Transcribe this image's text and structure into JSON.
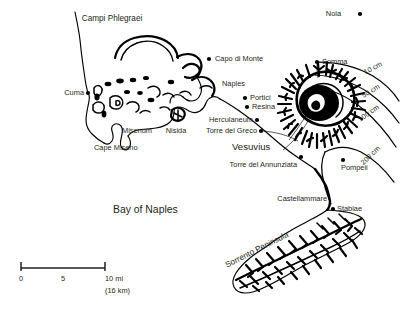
{
  "map": {
    "title_region": "Bay of Naples",
    "volcano": "Vesuvius",
    "regions": [
      {
        "name": "Campi Phlegraei",
        "x": 112,
        "y": 21
      },
      {
        "name": "Sorrento Peninsula",
        "x": 258,
        "y": 252,
        "rotate": -27
      }
    ],
    "places": [
      {
        "name": "Nola",
        "label_x": 341,
        "label_y": 16,
        "anchor": "end",
        "dot_x": 360,
        "dot_y": 14
      },
      {
        "name": "Somma",
        "label_x": 322,
        "label_y": 64,
        "anchor": "start",
        "dot_x": 317,
        "dot_y": 62
      },
      {
        "name": "Capo di Monte",
        "label_x": 215,
        "label_y": 61,
        "anchor": "start",
        "dot_x": 209,
        "dot_y": 59
      },
      {
        "name": "Naples",
        "label_x": 222,
        "label_y": 86,
        "anchor": "start",
        "dot_x": null,
        "dot_y": null
      },
      {
        "name": "Cuma",
        "label_x": 84,
        "label_y": 95,
        "anchor": "end",
        "dot_x": 88,
        "dot_y": 93
      },
      {
        "name": "Portici",
        "label_x": 250,
        "label_y": 100,
        "anchor": "start",
        "dot_x": 245,
        "dot_y": 98
      },
      {
        "name": "Resina",
        "label_x": 252,
        "label_y": 109,
        "anchor": "start",
        "dot_x": 247,
        "dot_y": 107
      },
      {
        "name": "Nisida",
        "label_x": 176,
        "label_y": 133,
        "anchor": "middle",
        "dot_x": null,
        "dot_y": null
      },
      {
        "name": "Misenum",
        "label_x": 122,
        "label_y": 133,
        "anchor": "start",
        "dot_x": null,
        "dot_y": null
      },
      {
        "name": "Herculaneum",
        "label_x": 253,
        "label_y": 122,
        "anchor": "end",
        "dot_x": 257,
        "dot_y": 120
      },
      {
        "name": "Torre del Greco",
        "label_x": 257,
        "label_y": 133,
        "anchor": "end",
        "dot_x": 261,
        "dot_y": 131
      },
      {
        "name": "Cape Miseno",
        "label_x": 94,
        "label_y": 150,
        "anchor": "start",
        "dot_x": null,
        "dot_y": null
      },
      {
        "name": "Torre del Annunziata",
        "label_x": 297,
        "label_y": 167,
        "anchor": "end",
        "dot_x": 301,
        "dot_y": 157
      },
      {
        "name": "Pompeii",
        "label_x": 341,
        "label_y": 170,
        "anchor": "start",
        "dot_x": 343,
        "dot_y": 160
      },
      {
        "name": "Castellammare",
        "label_x": 327,
        "label_y": 201,
        "anchor": "end",
        "dot_x": null,
        "dot_y": null
      },
      {
        "name": "Stabiae",
        "label_x": 337,
        "label_y": 211,
        "anchor": "start",
        "dot_x": 333,
        "dot_y": 209
      }
    ],
    "isopachs": [
      {
        "label": "10 cm",
        "label_x": 374,
        "label_y": 70,
        "rotate": -28
      },
      {
        "label": "50 cm",
        "label_x": 372,
        "label_y": 93,
        "rotate": -31
      },
      {
        "label": "100 cm",
        "label_x": 370,
        "label_y": 115,
        "rotate": -35
      },
      {
        "label": "200 cm",
        "label_x": 372,
        "label_y": 157,
        "rotate": -44
      }
    ],
    "scale": {
      "ticks": [
        "0",
        "5",
        "10 mi"
      ],
      "metric": "(16 km)"
    },
    "colors": {
      "ink": "#000000",
      "text": "#231f20",
      "background": "#ffffff"
    }
  }
}
